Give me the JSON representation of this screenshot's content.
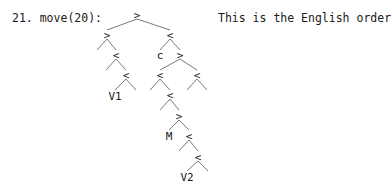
{
  "step": {
    "label": "21. move(20):"
  },
  "note": {
    "text": "This is the English order"
  },
  "tree": {
    "nodes": [
      {
        "id": "n0",
        "label": ">",
        "x": 137,
        "y": 16
      },
      {
        "id": "n1",
        "label": ">",
        "x": 107,
        "y": 36
      },
      {
        "id": "n2",
        "label": "<",
        "x": 170,
        "y": 36
      },
      {
        "id": "n3",
        "label": "<",
        "x": 116,
        "y": 56
      },
      {
        "id": "n4",
        "label": "c",
        "x": 160,
        "y": 56
      },
      {
        "id": "n5",
        "label": ">",
        "x": 180,
        "y": 56
      },
      {
        "id": "n6",
        "label": "<",
        "x": 126,
        "y": 76
      },
      {
        "id": "n7",
        "label": "<",
        "x": 160,
        "y": 76
      },
      {
        "id": "n8",
        "label": "<",
        "x": 197,
        "y": 76
      },
      {
        "id": "n9",
        "label": "V1",
        "x": 115,
        "y": 97
      },
      {
        "id": "n10",
        "label": "<",
        "x": 170,
        "y": 96
      },
      {
        "id": "n11",
        "label": ">",
        "x": 179,
        "y": 117
      },
      {
        "id": "n12",
        "label": "M",
        "x": 169,
        "y": 137
      },
      {
        "id": "n13",
        "label": "<",
        "x": 189,
        "y": 137
      },
      {
        "id": "n14",
        "label": "<",
        "x": 198,
        "y": 158
      },
      {
        "id": "n15",
        "label": "V2",
        "x": 187,
        "y": 178
      }
    ],
    "edges": [
      {
        "x1": 137,
        "y1": 19,
        "x2": 107,
        "y2": 30
      },
      {
        "x1": 137,
        "y1": 19,
        "x2": 170,
        "y2": 30
      },
      {
        "x1": 107,
        "y1": 39,
        "x2": 97,
        "y2": 50
      },
      {
        "x1": 107,
        "y1": 39,
        "x2": 116,
        "y2": 50
      },
      {
        "x1": 170,
        "y1": 39,
        "x2": 160,
        "y2": 50
      },
      {
        "x1": 170,
        "y1": 39,
        "x2": 180,
        "y2": 50
      },
      {
        "x1": 116,
        "y1": 59,
        "x2": 106,
        "y2": 70
      },
      {
        "x1": 116,
        "y1": 59,
        "x2": 126,
        "y2": 70
      },
      {
        "x1": 180,
        "y1": 59,
        "x2": 160,
        "y2": 70
      },
      {
        "x1": 180,
        "y1": 59,
        "x2": 197,
        "y2": 70
      },
      {
        "x1": 126,
        "y1": 79,
        "x2": 115,
        "y2": 90
      },
      {
        "x1": 126,
        "y1": 79,
        "x2": 136,
        "y2": 90
      },
      {
        "x1": 160,
        "y1": 79,
        "x2": 150,
        "y2": 90
      },
      {
        "x1": 160,
        "y1": 79,
        "x2": 170,
        "y2": 90
      },
      {
        "x1": 197,
        "y1": 79,
        "x2": 187,
        "y2": 90
      },
      {
        "x1": 197,
        "y1": 79,
        "x2": 207,
        "y2": 90
      },
      {
        "x1": 170,
        "y1": 99,
        "x2": 160,
        "y2": 110
      },
      {
        "x1": 170,
        "y1": 99,
        "x2": 179,
        "y2": 110
      },
      {
        "x1": 179,
        "y1": 120,
        "x2": 169,
        "y2": 130
      },
      {
        "x1": 179,
        "y1": 120,
        "x2": 189,
        "y2": 130
      },
      {
        "x1": 189,
        "y1": 140,
        "x2": 179,
        "y2": 151
      },
      {
        "x1": 189,
        "y1": 140,
        "x2": 198,
        "y2": 151
      },
      {
        "x1": 198,
        "y1": 161,
        "x2": 187,
        "y2": 171
      },
      {
        "x1": 198,
        "y1": 161,
        "x2": 208,
        "y2": 171
      }
    ]
  }
}
